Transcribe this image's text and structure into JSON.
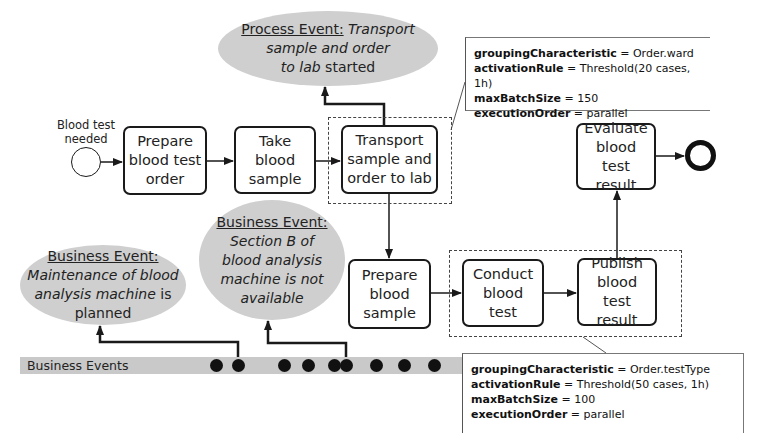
{
  "diagram": {
    "type": "BPMN process with batch activities and event stream",
    "start_event": {
      "label": "Blood test\nneeded"
    },
    "end_event": {
      "label": ""
    },
    "tasks": [
      {
        "id": "t1",
        "label": "Prepare\nblood test\norder"
      },
      {
        "id": "t2",
        "label": "Take\nblood\nsample"
      },
      {
        "id": "t3",
        "label": "Transport\nsample and\norder to lab"
      },
      {
        "id": "t4",
        "label": "Prepare\nblood\nsample"
      },
      {
        "id": "t5",
        "label": "Conduct\nblood test"
      },
      {
        "id": "t6",
        "label": "Publish\nblood test\nresult"
      },
      {
        "id": "t7",
        "label": "Evaluate\nblood test\nresult"
      }
    ],
    "flows": [
      [
        "start",
        "t1"
      ],
      [
        "t1",
        "t2"
      ],
      [
        "t2",
        "t3"
      ],
      [
        "t3",
        "t4"
      ],
      [
        "t4",
        "t5"
      ],
      [
        "t5",
        "t6"
      ],
      [
        "t6",
        "t7"
      ],
      [
        "t7",
        "end"
      ]
    ],
    "process_event": {
      "head": "Process Event:",
      "body_italic": "Transport\nsample and order\nto lab",
      "tail": "started"
    },
    "business_events": [
      {
        "head": "Business Event:",
        "body_italic": "Maintenance of blood\nanalysis machine",
        "tail": "is\nplanned"
      },
      {
        "head": "Business Event:",
        "body_italic": "Section B of\nblood analysis\nmachine is not\navailable",
        "tail": ""
      }
    ],
    "lane": {
      "label": "Business Events",
      "dot_count": 9
    },
    "batch_annotations": [
      {
        "target": "Transport sample and order to lab",
        "rows": [
          {
            "key": "groupingCharacteristic",
            "value": " = Order.ward"
          },
          {
            "key": "activationRule",
            "value": " = Threshold(20 cases, 1h)"
          },
          {
            "key": "maxBatchSize",
            "value": " = 150"
          },
          {
            "key": "executionOrder",
            "value": " = parallel"
          }
        ]
      },
      {
        "target": "Conduct blood test + Publish blood test result",
        "rows": [
          {
            "key": "groupingCharacteristic",
            "value": " = Order.testType"
          },
          {
            "key": "activationRule",
            "value": " = Threshold(50 cases, 1h)"
          },
          {
            "key": "maxBatchSize",
            "value": " = 100"
          },
          {
            "key": "executionOrder",
            "value": " = parallel"
          }
        ]
      }
    ],
    "colors": {
      "ellipse_fill": "#cfcfcf",
      "lane_fill": "#c9c9c9",
      "stroke": "#1a1a1a"
    }
  }
}
